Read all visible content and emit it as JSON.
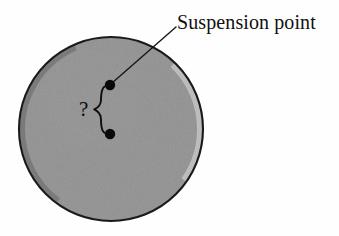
{
  "figure": {
    "type": "physics-diagram",
    "background_color": "#fefefe"
  },
  "disk": {
    "name": "circular-disk",
    "fill_color": "#9a9a9a",
    "outline_color": "#1a1a1a",
    "highlight_rim_color": "#c9c9c9",
    "shadow_rim_color": "#6d6d6d",
    "center_x": 111,
    "center_y": 129,
    "radius": 92
  },
  "points": [
    {
      "name": "suspension-point",
      "x": 110,
      "y": 85,
      "radius": 5.2,
      "color": "#0a0a0a"
    },
    {
      "name": "center-of-mass-point",
      "x": 110,
      "y": 134,
      "radius": 5.2,
      "color": "#0a0a0a"
    }
  ],
  "leader_line": {
    "name": "suspension-leader-line",
    "from_x": 112,
    "from_y": 83,
    "to_x": 176,
    "to_y": 27,
    "color": "#111111",
    "width": 1.3
  },
  "brace": {
    "name": "distance-brace",
    "orientation": "right-curly-vertical",
    "top_y": 85,
    "bottom_y": 134,
    "x": 100,
    "color": "#0d0d0d",
    "width": 1.8
  },
  "labels": {
    "suspension_point": "Suspension point",
    "unknown_distance": "?"
  },
  "colors": {
    "ink": "#111111",
    "disk_gray": "#9a9a9a",
    "paper": "#fefefe"
  }
}
